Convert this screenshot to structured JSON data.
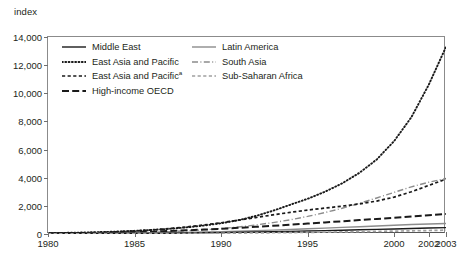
{
  "axis_unit_label": "index",
  "legend": {
    "entries": [
      {
        "label": "Middle East",
        "style": "solid",
        "color": "#1a1a1a",
        "column": "left"
      },
      {
        "label": "Latin America",
        "style": "solid",
        "color": "#8c8c8c",
        "column": "right"
      },
      {
        "label": "East Asia and Pacific",
        "style": "dotted",
        "color": "#1a1a1a",
        "column": "left"
      },
      {
        "label": "South Asia",
        "style": "dashdot",
        "color": "#8c8c8c",
        "column": "right"
      },
      {
        "label": "East Asia and Pacific",
        "superscript": "a",
        "style": "dashed-short",
        "color": "#1a1a1a",
        "column": "left"
      },
      {
        "label": "Sub-Saharan Africa",
        "style": "dashed-short",
        "color": "#a0a0a0",
        "column": "right"
      },
      {
        "label": "High-income OECD",
        "style": "dashed-long",
        "color": "#1a1a1a",
        "column": "left"
      }
    ]
  },
  "chart_data": {
    "type": "line",
    "title": "",
    "xlabel": "",
    "ylabel": "index",
    "xlim": [
      1980,
      2003
    ],
    "ylim": [
      0,
      14000
    ],
    "ytick_step": 2000,
    "grid": false,
    "legend_position": "top-left-inside",
    "x": [
      1980,
      1981,
      1982,
      1983,
      1984,
      1985,
      1986,
      1987,
      1988,
      1989,
      1990,
      1991,
      1992,
      1993,
      1994,
      1995,
      1996,
      1997,
      1998,
      1999,
      2000,
      2001,
      2002,
      2003
    ],
    "xticks": [
      1980,
      1985,
      1990,
      1995,
      2000,
      2002,
      2003
    ],
    "xtick_labels": [
      "1980",
      "1985",
      "1990",
      "1995",
      "2000",
      "2002",
      "2003"
    ],
    "yticks": [
      0,
      2000,
      4000,
      6000,
      8000,
      10000,
      12000,
      14000
    ],
    "ytick_labels": [
      "0",
      "2,000",
      "4,000",
      "6,000",
      "8,000",
      "10,000",
      "12,000",
      "14,000"
    ],
    "series": [
      {
        "name": "East Asia and Pacific",
        "style": "dotted",
        "color": "#1a1a1a",
        "values": [
          60,
          80,
          105,
          135,
          175,
          225,
          290,
          370,
          470,
          600,
          760,
          980,
          1280,
          1650,
          2080,
          2500,
          3000,
          3600,
          4350,
          5300,
          6600,
          8300,
          10600,
          13300
        ]
      },
      {
        "name": "South Asia",
        "style": "dashdot",
        "color": "#8c8c8c",
        "values": [
          20,
          28,
          38,
          52,
          70,
          95,
          128,
          170,
          225,
          295,
          385,
          500,
          640,
          810,
          1010,
          1250,
          1520,
          1830,
          2180,
          2560,
          2960,
          3350,
          3680,
          3950
        ]
      },
      {
        "name": "East Asia and Pacific",
        "superscript": "a",
        "style": "dashed-short",
        "color": "#1a1a1a",
        "values": [
          40,
          58,
          82,
          115,
          158,
          215,
          290,
          385,
          500,
          640,
          800,
          980,
          1170,
          1360,
          1540,
          1700,
          1840,
          1980,
          2140,
          2340,
          2620,
          3000,
          3450,
          3900
        ]
      },
      {
        "name": "High-income OECD",
        "style": "dashed-long",
        "color": "#1a1a1a",
        "values": [
          30,
          42,
          58,
          78,
          102,
          132,
          168,
          210,
          258,
          312,
          372,
          438,
          508,
          582,
          660,
          740,
          822,
          905,
          988,
          1070,
          1150,
          1240,
          1330,
          1420
        ]
      },
      {
        "name": "Latin America",
        "style": "solid",
        "color": "#8c8c8c",
        "values": [
          15,
          20,
          27,
          36,
          47,
          60,
          76,
          95,
          117,
          142,
          170,
          202,
          238,
          278,
          322,
          370,
          420,
          470,
          520,
          570,
          620,
          670,
          710,
          745
        ]
      },
      {
        "name": "Middle East",
        "style": "solid",
        "color": "#1a1a1a",
        "values": [
          10,
          13,
          17,
          22,
          28,
          36,
          45,
          56,
          69,
          84,
          101,
          120,
          141,
          164,
          189,
          216,
          243,
          271,
          300,
          330,
          360,
          392,
          424,
          455
        ]
      },
      {
        "name": "Sub-Saharan Africa",
        "style": "dashed-short",
        "color": "#a0a0a0",
        "values": [
          5,
          7,
          9,
          12,
          15,
          19,
          24,
          30,
          37,
          45,
          54,
          64,
          75,
          88,
          101,
          116,
          132,
          149,
          167,
          186,
          206,
          227,
          249,
          272
        ]
      }
    ]
  }
}
